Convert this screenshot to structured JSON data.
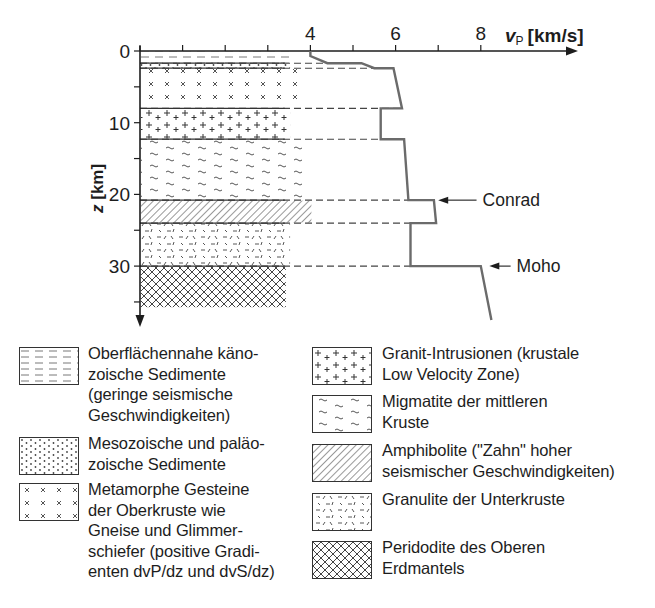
{
  "chart_data": {
    "type": "diagram",
    "title": "",
    "x_axis": {
      "label_var": "v",
      "label_sub": "P",
      "label_unit": "[km/s]",
      "ticks": [
        0,
        1,
        2,
        3,
        4,
        5,
        6,
        7,
        8
      ],
      "tick_labels": {
        "4": "4",
        "6": "6",
        "8": "8"
      },
      "range": [
        0,
        10.2
      ]
    },
    "y_axis": {
      "label_var": "z",
      "label_unit": "[km]",
      "ticks": [
        0,
        5,
        10,
        15,
        20,
        25,
        30,
        35
      ],
      "tick_labels": {
        "0": "0",
        "10": "10",
        "20": "20",
        "30": "30"
      },
      "range": [
        0,
        37.5
      ],
      "inverted": true
    },
    "layers": [
      {
        "id": "sediments-cenozoic",
        "pattern": "dash",
        "z_top": 0,
        "z_bottom": 1.7,
        "vmax": 3.5
      },
      {
        "id": "sediments-mesozoic",
        "pattern": "dots",
        "z_top": 1.7,
        "z_bottom": 2.4,
        "vmax": 3.5
      },
      {
        "id": "metamorphic",
        "pattern": "cross",
        "z_top": 2.4,
        "z_bottom": 8.0,
        "vmax": 3.8
      },
      {
        "id": "granite",
        "pattern": "plus",
        "z_top": 8.0,
        "z_bottom": 12.3,
        "vmax": 3.5
      },
      {
        "id": "migmatite",
        "pattern": "wave",
        "z_top": 12.3,
        "z_bottom": 20.8,
        "vmax": 3.8
      },
      {
        "id": "amphibolite",
        "pattern": "hatch",
        "z_top": 20.8,
        "z_bottom": 24.0,
        "vmax": 4.0
      },
      {
        "id": "granulite",
        "pattern": "ticks",
        "z_top": 24.0,
        "z_bottom": 30.0,
        "vmax": 3.5
      },
      {
        "id": "peridotite",
        "pattern": "crosshatch",
        "z_top": 30.0,
        "z_bottom": 35.8,
        "vmax": 3.4
      }
    ],
    "boundaries_dashed_z": [
      1.7,
      2.4,
      8.0,
      12.3,
      20.8,
      24.0,
      30.0
    ],
    "vp_profile": [
      [
        4.0,
        0
      ],
      [
        4.0,
        0.7
      ],
      [
        4.4,
        1.7
      ],
      [
        5.2,
        1.7
      ],
      [
        5.5,
        2.4
      ],
      [
        5.95,
        2.4
      ],
      [
        6.15,
        8.0
      ],
      [
        5.65,
        8.0
      ],
      [
        5.65,
        12.3
      ],
      [
        6.2,
        12.3
      ],
      [
        6.3,
        20.8
      ],
      [
        6.9,
        20.8
      ],
      [
        6.95,
        24.0
      ],
      [
        6.35,
        24.0
      ],
      [
        6.35,
        30.0
      ],
      [
        8.0,
        30.0
      ],
      [
        8.25,
        37.5
      ]
    ],
    "annotations": [
      {
        "label": "Conrad",
        "z": 20.8,
        "arrow_from_v": 7.9,
        "arrow_to_v": 7.0
      },
      {
        "label": "Moho",
        "z": 30.0,
        "arrow_from_v": 8.7,
        "arrow_to_v": 8.2
      }
    ]
  },
  "legend": {
    "left": [
      {
        "pattern": "dash",
        "lines": [
          "Oberflächennahe käno-",
          "zoische Sedimente",
          "(geringe seismische",
          "Geschwindigkeiten)"
        ]
      },
      {
        "pattern": "dots",
        "lines": [
          "Mesozoische und paläo-",
          "zoische Sedimente"
        ]
      },
      {
        "pattern": "cross",
        "lines": [
          "Metamorphe Gesteine",
          "der Oberkruste wie",
          "Gneise und Glimmer-",
          "schiefer (positive Gradi-",
          "enten dvP/dz und dvS/dz)"
        ]
      }
    ],
    "right": [
      {
        "pattern": "plus",
        "lines": [
          "Granit-Intrusionen (krustale",
          "Low Velocity Zone)"
        ]
      },
      {
        "pattern": "wave",
        "lines": [
          "Migmatite der mittleren",
          "Kruste"
        ]
      },
      {
        "pattern": "hatch",
        "lines": [
          "Amphibolite (\"Zahn\" hoher",
          "seismischer Geschwindigkeiten)"
        ]
      },
      {
        "pattern": "ticks",
        "lines": [
          "Granulite der Unterkruste"
        ]
      },
      {
        "pattern": "crosshatch",
        "lines": [
          "Peridodite des Oberen",
          "Erdmantels"
        ]
      }
    ]
  },
  "colors": {
    "ink": "#1d1d1d",
    "profile": "#6b6b6b",
    "pattern": "#4a4a4a"
  }
}
